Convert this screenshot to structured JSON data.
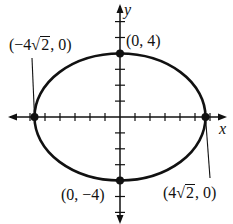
{
  "figure": {
    "type": "ellipse",
    "equation_implied": "x^2/32 + y^2/16 = 1",
    "colors": {
      "stroke": "#111111",
      "background": "#ffffff"
    }
  },
  "axes": {
    "x_label": "x",
    "y_label": "y",
    "origin_px": [
      120,
      117
    ],
    "x_unit_px": 15,
    "y_unit_px": 15.9,
    "x_ticks": [
      -6,
      -5,
      -4,
      -3,
      -2,
      -1,
      1,
      2,
      3,
      4,
      5,
      6
    ],
    "y_ticks": [
      6,
      5,
      4,
      3,
      2,
      1,
      -1,
      -2,
      -3,
      -4,
      -5,
      -6
    ]
  },
  "points": [
    {
      "id": "left-vertex",
      "x": "-4√2",
      "y": 0,
      "label_prefix": "(−4",
      "label_radicand": "2",
      "label_suffix": ", 0)"
    },
    {
      "id": "top-covertex",
      "x": 0,
      "y": 4,
      "label": "(0, 4)"
    },
    {
      "id": "right-vertex",
      "x": "4√2",
      "y": 0,
      "label_prefix": "(4",
      "label_radicand": "2",
      "label_suffix": ", 0)"
    },
    {
      "id": "bottom-covertex",
      "x": 0,
      "y": -4,
      "label": "(0, −4)"
    }
  ],
  "labels": {
    "left_prefix": "(−4",
    "left_radicand": "2",
    "left_suffix": ", 0)",
    "top": "(0, 4)",
    "bottom": "(0, −4)",
    "right_prefix": "(4",
    "right_radicand": "2",
    "right_suffix": ", 0)",
    "sqrt_sign": "√"
  }
}
